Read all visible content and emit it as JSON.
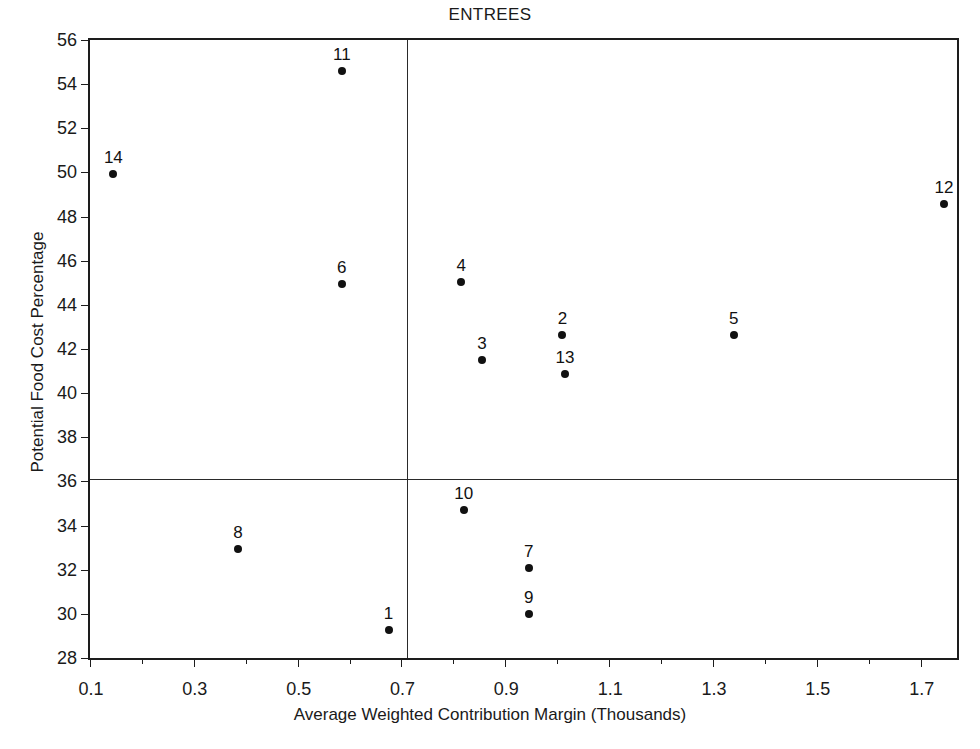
{
  "chart_data": {
    "type": "scatter",
    "title": "ENTREES",
    "xlabel": "Average Weighted Contribution Margin (Thousands)",
    "ylabel": "Potential Food Cost Percentage",
    "xlim": [
      0.1,
      1.77
    ],
    "ylim": [
      28,
      56
    ],
    "xtick_step": 0.1,
    "ytick_step": 2,
    "grid": false,
    "legend": null,
    "xticks": [
      {
        "value": 0.1,
        "label": "0.1"
      },
      {
        "value": 0.2,
        "label": ""
      },
      {
        "value": 0.3,
        "label": "0.3"
      },
      {
        "value": 0.4,
        "label": ""
      },
      {
        "value": 0.5,
        "label": "0.5"
      },
      {
        "value": 0.6,
        "label": ""
      },
      {
        "value": 0.7,
        "label": "0.7"
      },
      {
        "value": 0.8,
        "label": ""
      },
      {
        "value": 0.9,
        "label": "0.9"
      },
      {
        "value": 1.0,
        "label": ""
      },
      {
        "value": 1.1,
        "label": "1.1"
      },
      {
        "value": 1.2,
        "label": ""
      },
      {
        "value": 1.3,
        "label": "1.3"
      },
      {
        "value": 1.4,
        "label": ""
      },
      {
        "value": 1.5,
        "label": "1.5"
      },
      {
        "value": 1.6,
        "label": ""
      },
      {
        "value": 1.7,
        "label": "1.7"
      }
    ],
    "yticks": [
      {
        "value": 28,
        "label": "28"
      },
      {
        "value": 30,
        "label": "30"
      },
      {
        "value": 32,
        "label": "32"
      },
      {
        "value": 34,
        "label": "34"
      },
      {
        "value": 36,
        "label": "36"
      },
      {
        "value": 38,
        "label": "38"
      },
      {
        "value": 40,
        "label": "40"
      },
      {
        "value": 42,
        "label": "42"
      },
      {
        "value": 44,
        "label": "44"
      },
      {
        "value": 46,
        "label": "46"
      },
      {
        "value": 48,
        "label": "48"
      },
      {
        "value": 50,
        "label": "50"
      },
      {
        "value": 52,
        "label": "52"
      },
      {
        "value": 54,
        "label": "54"
      },
      {
        "value": 56,
        "label": "56"
      }
    ],
    "reference_lines": [
      {
        "orientation": "vertical",
        "value": 0.71,
        "axis": "x"
      },
      {
        "orientation": "horizontal",
        "value": 36.1,
        "axis": "y"
      }
    ],
    "points": [
      {
        "label": "1",
        "x": 0.675,
        "y": 29.25
      },
      {
        "label": "2",
        "x": 1.01,
        "y": 42.65
      },
      {
        "label": "3",
        "x": 0.855,
        "y": 41.5
      },
      {
        "label": "4",
        "x": 0.815,
        "y": 45.05
      },
      {
        "label": "5",
        "x": 1.34,
        "y": 42.65
      },
      {
        "label": "6",
        "x": 0.585,
        "y": 44.95
      },
      {
        "label": "7",
        "x": 0.945,
        "y": 32.1
      },
      {
        "label": "8",
        "x": 0.385,
        "y": 32.95
      },
      {
        "label": "9",
        "x": 0.945,
        "y": 30.0
      },
      {
        "label": "10",
        "x": 0.82,
        "y": 34.7
      },
      {
        "label": "11",
        "x": 0.585,
        "y": 54.6
      },
      {
        "label": "12",
        "x": 1.745,
        "y": 48.55
      },
      {
        "label": "13",
        "x": 1.015,
        "y": 40.85
      },
      {
        "label": "14",
        "x": 0.145,
        "y": 49.95
      }
    ],
    "colors": {
      "marker": "#111111",
      "axis": "#1d1d1d",
      "reference_line": "#2a2a2a",
      "background": "#ffffff",
      "text": "#1a1a1a"
    }
  }
}
